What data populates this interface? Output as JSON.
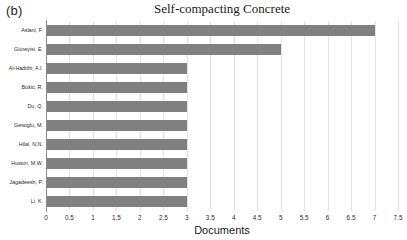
{
  "panel": {
    "label": "(b)"
  },
  "chart_data": {
    "type": "bar",
    "orientation": "horizontal",
    "title": "Self-compacting Concrete",
    "xlabel": "Documents",
    "ylabel": "",
    "categories": [
      "Aslani, F.",
      "Güneyisi, E.",
      "Al-Hadithi, A.I.",
      "Bušić, R.",
      "Du, Q.",
      "Gesoglu, M.",
      "Hilal, N.N.",
      "Hussin, M.W.",
      "Jagadeesh, P.",
      "Li, K."
    ],
    "values": [
      7,
      5,
      3,
      3,
      3,
      3,
      3,
      3,
      3,
      3
    ],
    "xlim": [
      0,
      7.5
    ],
    "xticks": [
      "0",
      "0.5",
      "1",
      "1.5",
      "2",
      "2.5",
      "3",
      "3.5",
      "4",
      "4.5",
      "5",
      "5.5",
      "6",
      "6.5",
      "7",
      "7.5"
    ],
    "xtick_values": [
      0,
      0.5,
      1,
      1.5,
      2,
      2.5,
      3,
      3.5,
      4,
      4.5,
      5,
      5.5,
      6,
      6.5,
      7,
      7.5
    ],
    "grid": "vertical",
    "legend": "none",
    "bar_color": "#808080",
    "grid_color": "#e2e2e2",
    "axis_color": "#8c8c8c"
  }
}
